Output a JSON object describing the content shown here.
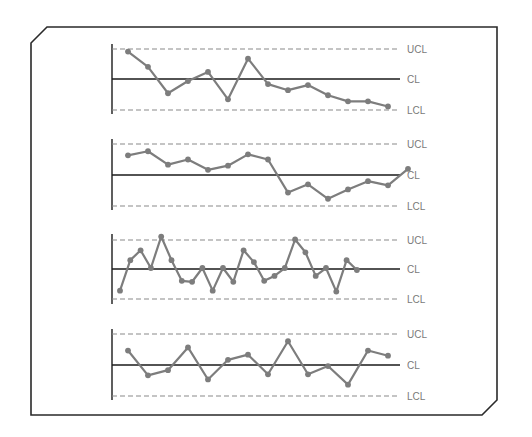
{
  "figure": {
    "frame_color": "#2a2a2a",
    "series_color": "#7d7d7d",
    "limit_line_color": "#8a8a8a",
    "center_line_color": "#1a1a1a",
    "label_color": "#7a7a7a"
  },
  "labels": {
    "ucl": "UCL",
    "cl": "CL",
    "lcl": "LCL"
  },
  "chart_data": [
    {
      "type": "line",
      "title": "",
      "xlabel": "",
      "ylabel": "",
      "description": "Control chart 1 — downward trend",
      "limits": {
        "UCL": 3,
        "CL": 0,
        "LCL": -3
      },
      "ylim": [
        -3.6,
        3.6
      ],
      "grid": false,
      "x": [
        1,
        2,
        3,
        4,
        5,
        6,
        7,
        8,
        9,
        10,
        11,
        12,
        13,
        14
      ],
      "values": [
        2.7,
        1.2,
        -1.4,
        -0.2,
        0.7,
        -2.0,
        2.0,
        -0.5,
        -1.1,
        -0.6,
        -1.6,
        -2.2,
        -2.2,
        -2.7
      ]
    },
    {
      "type": "line",
      "title": "",
      "xlabel": "",
      "ylabel": "",
      "description": "Control chart 2 — shift in process level",
      "limits": {
        "UCL": 3,
        "CL": 0,
        "LCL": -3
      },
      "ylim": [
        -3.6,
        3.6
      ],
      "grid": false,
      "x": [
        1,
        2,
        3,
        4,
        5,
        6,
        7,
        8,
        9,
        10,
        11,
        12,
        13,
        14,
        15
      ],
      "values": [
        1.9,
        2.3,
        1.0,
        1.5,
        0.5,
        0.9,
        2.0,
        1.5,
        -1.7,
        -0.9,
        -2.3,
        -1.4,
        -0.6,
        -1.0,
        0.6
      ]
    },
    {
      "type": "line",
      "title": "",
      "xlabel": "",
      "ylabel": "",
      "description": "Control chart 3 — points beyond control limits",
      "limits": {
        "UCL": 3,
        "CL": 0,
        "LCL": -3
      },
      "ylim": [
        -3.6,
        3.6
      ],
      "grid": false,
      "x": [
        1,
        2,
        3,
        4,
        5,
        6,
        7,
        8,
        9,
        10,
        11,
        12,
        13,
        14,
        15,
        16,
        17,
        18,
        19,
        20,
        21,
        22,
        23,
        24
      ],
      "values": [
        -2.2,
        0.9,
        1.9,
        0.1,
        3.3,
        0.9,
        -1.2,
        -1.3,
        0.1,
        -2.2,
        0.1,
        -1.3,
        1.9,
        0.7,
        -1.2,
        -0.7,
        0.1,
        3.0,
        1.7,
        -0.7,
        0.1,
        -2.3,
        0.9,
        -0.1
      ]
    },
    {
      "type": "line",
      "title": "",
      "xlabel": "",
      "ylabel": "",
      "description": "Control chart 4 — process in control",
      "limits": {
        "UCL": 3,
        "CL": 0,
        "LCL": -3
      },
      "ylim": [
        -3.6,
        3.6
      ],
      "grid": false,
      "x": [
        1,
        2,
        3,
        4,
        5,
        6,
        7,
        8,
        9,
        10,
        11,
        12,
        13,
        14
      ],
      "values": [
        1.4,
        -1.0,
        -0.5,
        1.7,
        -1.4,
        0.5,
        1.0,
        -0.9,
        2.3,
        -0.9,
        -0.1,
        -1.9,
        1.4,
        0.9
      ]
    }
  ],
  "layout": {
    "panels": [
      {
        "axis_x": 112,
        "axis_top": 44,
        "axis_bottom": 114,
        "ucl_y": 49,
        "cl_y": 79,
        "lcl_y": 110,
        "x0": 128,
        "dx": 20,
        "line_end": 400,
        "label_x": 407
      },
      {
        "axis_x": 112,
        "axis_top": 139,
        "axis_bottom": 210,
        "ucl_y": 144,
        "cl_y": 175,
        "lcl_y": 206,
        "x0": 128,
        "dx": 20,
        "line_end": 400,
        "label_x": 407
      },
      {
        "axis_x": 112,
        "axis_top": 234,
        "axis_bottom": 304,
        "ucl_y": 240,
        "cl_y": 269,
        "lcl_y": 299,
        "x0": 120,
        "dx": 10.3,
        "line_end": 400,
        "label_x": 407
      },
      {
        "axis_x": 112,
        "axis_top": 329,
        "axis_bottom": 400,
        "ucl_y": 334,
        "cl_y": 365,
        "lcl_y": 396,
        "x0": 128,
        "dx": 20,
        "line_end": 400,
        "label_x": 407
      }
    ]
  }
}
